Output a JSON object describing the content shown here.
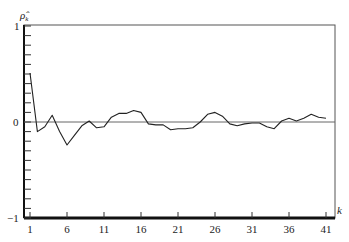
{
  "chart_data": {
    "type": "line",
    "title": "",
    "xlabel": "k",
    "ylabel": "ρ̂_k",
    "ylim": [
      -1,
      1
    ],
    "xlim": [
      1,
      41
    ],
    "grid": false,
    "legend": null,
    "y_ticks": [
      "1",
      "0",
      "−1"
    ],
    "x_ticks": [
      "1",
      "6",
      "11",
      "16",
      "21",
      "26",
      "31",
      "36",
      "41"
    ],
    "reference_line": 0,
    "x": [
      1,
      2,
      3,
      4,
      5,
      6,
      7,
      8,
      9,
      10,
      11,
      12,
      13,
      14,
      15,
      16,
      17,
      18,
      19,
      20,
      21,
      22,
      23,
      24,
      25,
      26,
      27,
      28,
      29,
      30,
      31,
      32,
      33,
      34,
      35,
      36,
      37,
      38,
      39,
      40,
      41
    ],
    "series": [
      {
        "name": "sample autocorrelation",
        "values": [
          0.51,
          -0.1,
          -0.05,
          0.07,
          -0.1,
          -0.24,
          -0.14,
          -0.04,
          0.01,
          -0.06,
          -0.05,
          0.05,
          0.09,
          0.09,
          0.12,
          0.1,
          -0.02,
          -0.03,
          -0.03,
          -0.08,
          -0.07,
          -0.07,
          -0.06,
          0.0,
          0.08,
          0.1,
          0.06,
          -0.02,
          -0.04,
          -0.02,
          -0.01,
          -0.01,
          -0.05,
          -0.07,
          0.01,
          0.04,
          0.01,
          0.04,
          0.08,
          0.05,
          0.04
        ]
      }
    ]
  },
  "labels": {
    "y_axis_symbol": "ρ̂",
    "y_axis_sub": "k",
    "x_axis_symbol": "k",
    "y_top": "1",
    "y_zero": "0",
    "y_bottom": "−1"
  }
}
